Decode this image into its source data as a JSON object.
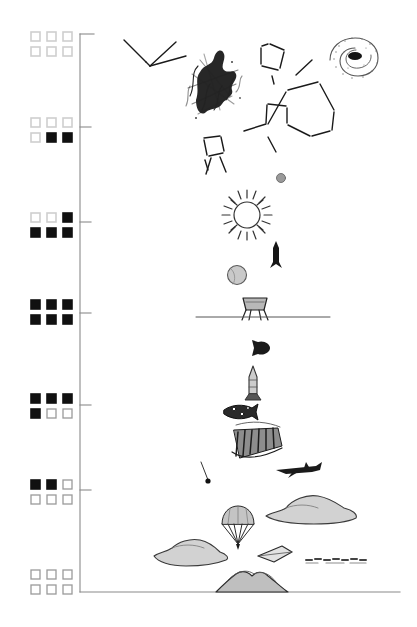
{
  "figure": {
    "title": "Altitude / scale ladder diagram",
    "background_color": "#ffffff",
    "ink_color": "#1a1a1a",
    "axis_color": "#8a8a8a",
    "width": 417,
    "height": 627
  },
  "axis": {
    "name": "vertical-scale-axis",
    "x": 80,
    "top_y": 34,
    "bottom_y": 592,
    "bracket_length": 14,
    "tick_length": 11,
    "tick_positions": [
      127,
      222,
      313,
      405,
      490
    ],
    "tick_labels": [
      "",
      "",
      "",
      "",
      ""
    ]
  },
  "legend": {
    "name": "six-square-level-indicator",
    "square_size": 9,
    "col_x": [
      31,
      47,
      63
    ],
    "row_gap": 15,
    "fill_black": "#111111",
    "stroke_light": "#cfcfcf",
    "stroke_empty": "#9a9a9a",
    "states": [
      "light",
      "black",
      "empty"
    ],
    "groups": [
      {
        "label": "level-1",
        "y": 32,
        "rows": [
          [
            "light",
            "light",
            "light"
          ],
          [
            "light",
            "light",
            "light"
          ]
        ]
      },
      {
        "label": "level-2",
        "y": 118,
        "rows": [
          [
            "light",
            "light",
            "light"
          ],
          [
            "light",
            "black",
            "black"
          ]
        ]
      },
      {
        "label": "level-3",
        "y": 213,
        "rows": [
          [
            "light",
            "light",
            "black"
          ],
          [
            "black",
            "black",
            "black"
          ]
        ]
      },
      {
        "label": "level-4",
        "y": 300,
        "rows": [
          [
            "black",
            "black",
            "black"
          ],
          [
            "black",
            "black",
            "black"
          ]
        ]
      },
      {
        "label": "level-5",
        "y": 394,
        "rows": [
          [
            "black",
            "black",
            "black"
          ],
          [
            "black",
            "empty",
            "empty"
          ]
        ]
      },
      {
        "label": "level-6",
        "y": 480,
        "rows": [
          [
            "black",
            "black",
            "empty"
          ],
          [
            "empty",
            "empty",
            "empty"
          ]
        ]
      },
      {
        "label": "level-7",
        "y": 570,
        "rows": [
          [
            "empty",
            "empty",
            "empty"
          ],
          [
            "empty",
            "empty",
            "empty"
          ]
        ]
      }
    ]
  },
  "sketches": [
    {
      "name": "constellation-zigzag",
      "kind": "line-figure",
      "cx": 150,
      "cy": 50,
      "note": "angular bent line, upper left"
    },
    {
      "name": "dark-scribble-nebula",
      "kind": "scribble",
      "cx": 208,
      "cy": 80,
      "note": "dense black ink blot"
    },
    {
      "name": "spiral-galaxy",
      "kind": "spiral",
      "cx": 355,
      "cy": 55,
      "note": "stippled spiral with dark core"
    },
    {
      "name": "constellation-quadrilateral",
      "kind": "line-figure",
      "cx": 273,
      "cy": 58,
      "note": "small angular outline"
    },
    {
      "name": "constellation-polygon",
      "kind": "line-figure",
      "cx": 303,
      "cy": 105,
      "note": "large connected star pattern"
    },
    {
      "name": "constellation-box",
      "kind": "line-figure",
      "cx": 215,
      "cy": 155,
      "note": "boxy star figure, left"
    },
    {
      "name": "distant-planet-dot",
      "kind": "disc",
      "cx": 281,
      "cy": 178,
      "r": 5
    },
    {
      "name": "sun-with-rays",
      "kind": "sun",
      "cx": 247,
      "cy": 215,
      "r": 14
    },
    {
      "name": "ascending-rocket",
      "kind": "rocket",
      "cx": 276,
      "cy": 253
    },
    {
      "name": "moon-disc",
      "kind": "disc-shaded",
      "cx": 237,
      "cy": 275,
      "r": 10
    },
    {
      "name": "lunar-lander",
      "kind": "lander",
      "cx": 255,
      "cy": 308
    },
    {
      "name": "ground-line-upper",
      "kind": "hline",
      "y": 317,
      "x1": 196,
      "x2": 330
    },
    {
      "name": "capsule-silhouette",
      "kind": "blob",
      "cx": 263,
      "cy": 347
    },
    {
      "name": "launch-rocket",
      "kind": "rocket-tall",
      "cx": 253,
      "cy": 380
    },
    {
      "name": "space-shuttle",
      "kind": "shuttle",
      "cx": 240,
      "cy": 410
    },
    {
      "name": "dark-hatched-mass",
      "kind": "hatch-blob",
      "cx": 255,
      "cy": 443
    },
    {
      "name": "jet-aircraft",
      "kind": "jet",
      "cx": 297,
      "cy": 468
    },
    {
      "name": "falling-probe",
      "kind": "tether-dot",
      "cx": 207,
      "cy": 478
    },
    {
      "name": "cloud-right",
      "kind": "cloud",
      "cx": 307,
      "cy": 505
    },
    {
      "name": "parachute",
      "kind": "parachute",
      "cx": 238,
      "cy": 525
    },
    {
      "name": "cloud-left",
      "kind": "cloud",
      "cx": 184,
      "cy": 547
    },
    {
      "name": "hang-glider",
      "kind": "glider",
      "cx": 274,
      "cy": 553
    },
    {
      "name": "dashed-streak",
      "kind": "dashes",
      "cx": 337,
      "cy": 559
    },
    {
      "name": "mountain-range",
      "kind": "mountain",
      "cx": 252,
      "cy": 585
    },
    {
      "name": "ground-line-lower",
      "kind": "hline",
      "y": 592,
      "x1": 80,
      "x2": 400
    }
  ]
}
